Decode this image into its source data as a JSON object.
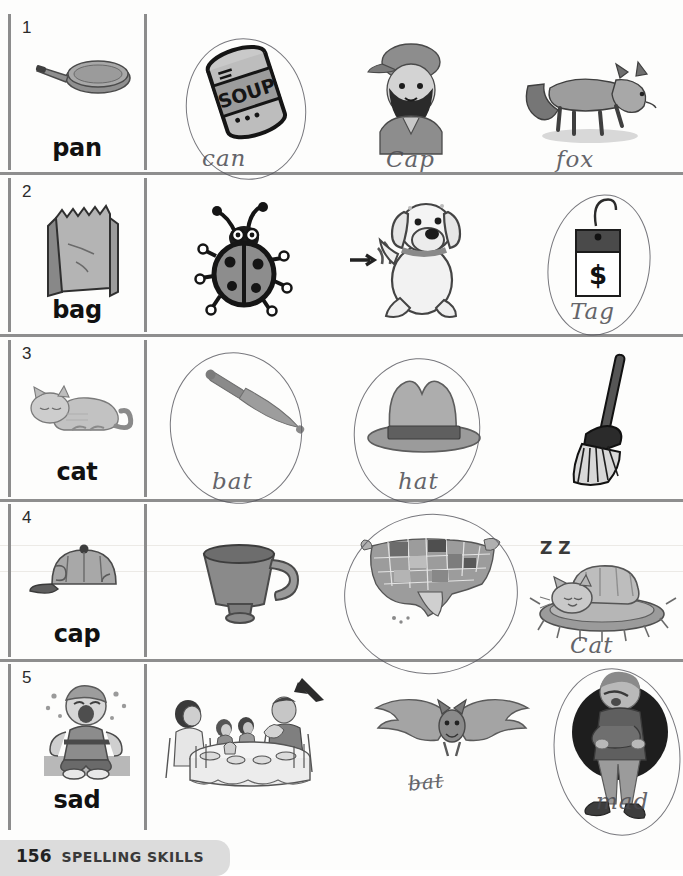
{
  "worksheet": {
    "footer": {
      "page_number": "156",
      "title": "Spelling Skills"
    }
  },
  "rows": [
    {
      "number": "1",
      "cue_word": "pan",
      "cue_icon": "frying-pan",
      "options": [
        {
          "icon": "soup-can",
          "label_text": "SOUP",
          "answer": "can",
          "circled": true,
          "crossed_out": false
        },
        {
          "icon": "man-with-cap",
          "label_text": "",
          "answer": "Cap",
          "circled": false,
          "crossed_out": false
        },
        {
          "icon": "fox",
          "label_text": "",
          "answer": "fox",
          "circled": false,
          "crossed_out": false
        }
      ]
    },
    {
      "number": "2",
      "cue_word": "bag",
      "cue_icon": "paper-bag",
      "options": [
        {
          "icon": "ladybug",
          "label_text": "",
          "answer": "",
          "circled": false,
          "crossed_out": false
        },
        {
          "icon": "wagging-dog",
          "label_text": "",
          "answer": "",
          "circled": false,
          "crossed_out": false
        },
        {
          "icon": "price-tag",
          "label_text": "$",
          "answer": "Tag",
          "circled": true,
          "crossed_out": false
        }
      ]
    },
    {
      "number": "3",
      "cue_word": "cat",
      "cue_icon": "sleeping-cat",
      "options": [
        {
          "icon": "baseball-bat",
          "label_text": "",
          "answer": "bat",
          "circled": true,
          "crossed_out": false
        },
        {
          "icon": "hat",
          "label_text": "",
          "answer": "hat",
          "circled": true,
          "crossed_out": false
        },
        {
          "icon": "broom",
          "label_text": "",
          "answer": "",
          "circled": false,
          "crossed_out": false
        }
      ]
    },
    {
      "number": "4",
      "cue_word": "cap",
      "cue_icon": "baseball-cap",
      "options": [
        {
          "icon": "cup",
          "label_text": "",
          "answer": "",
          "circled": false,
          "crossed_out": false
        },
        {
          "icon": "usa-map",
          "label_text": "",
          "answer": "",
          "circled": true,
          "crossed_out": false
        },
        {
          "icon": "cat-on-mat",
          "label_text": "Z Z",
          "answer": "Cat",
          "circled": false,
          "crossed_out": false
        }
      ]
    },
    {
      "number": "5",
      "cue_word": "sad",
      "cue_icon": "crying-boy",
      "options": [
        {
          "icon": "family-at-table",
          "label_text": "",
          "answer": "",
          "circled": false,
          "crossed_out": false
        },
        {
          "icon": "bat-animal",
          "label_text": "",
          "answer": "bat",
          "circled": false,
          "crossed_out": true
        },
        {
          "icon": "angry-person",
          "label_text": "",
          "answer": "mad",
          "circled": true,
          "crossed_out": false
        }
      ]
    }
  ],
  "colors": {
    "rule": "#8e8e8e",
    "ink": "#4a4a50",
    "text": "#111111",
    "art_gray": "#9a9a9a",
    "art_dark": "#3d3d3d"
  }
}
